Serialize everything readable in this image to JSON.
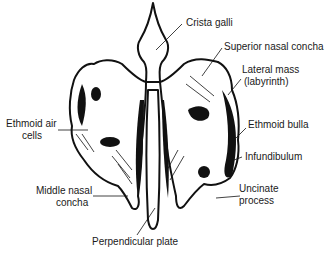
{
  "diagram": {
    "labels": {
      "crista_galli": "Crista galli",
      "superior_nasal_concha": "Superior nasal concha",
      "lateral_mass_1": "Lateral mass",
      "lateral_mass_2": "(labyrinth)",
      "ethmoid_air_cells_1": "Ethmoid air",
      "ethmoid_air_cells_2": "cells",
      "ethmoid_bulla": "Ethmoid bulla",
      "infundibulum": "Infundibulum",
      "middle_nasal_concha_1": "Middle nasal",
      "middle_nasal_concha_2": "concha",
      "uncinate_process_1": "Uncinate",
      "uncinate_process_2": "process",
      "perpendicular_plate": "Perpendicular plate"
    },
    "colors": {
      "ink": "#111111",
      "background": "#ffffff"
    }
  }
}
